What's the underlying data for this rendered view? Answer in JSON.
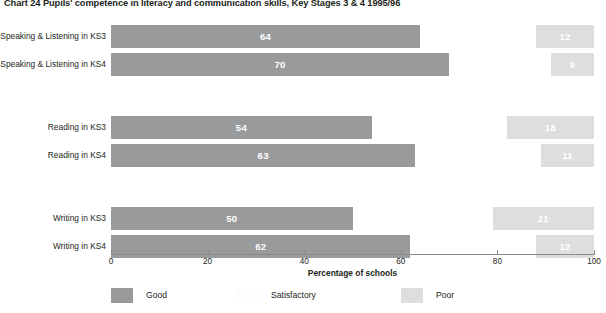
{
  "chart_data": {
    "type": "bar",
    "orientation": "horizontal",
    "stacked": true,
    "title": "Chart 24  Pupils' competence in literacy and communication skills, Key Stages 3 & 4 1995/96",
    "xlabel": "Percentage of schools",
    "ylabel": "",
    "xlim": [
      0,
      100
    ],
    "xticks": [
      0,
      20,
      40,
      60,
      80,
      100
    ],
    "xtick_labels": [
      "0",
      "20",
      "40",
      "60",
      "80",
      "100"
    ],
    "grid": false,
    "legend_position": "bottom",
    "categories": [
      "Speaking & Listening in KS3",
      "Speaking & Listening in KS4",
      "Reading in KS3",
      "Reading in KS4",
      "Writing in KS3",
      "Writing in KS4"
    ],
    "series": [
      {
        "name": "Good",
        "color": "#999a9c",
        "values": [
          64,
          70,
          54,
          63,
          50,
          62
        ],
        "labels": [
          "64",
          "70",
          "54",
          "63",
          "50",
          "62"
        ]
      },
      {
        "name": "Satisfactory",
        "color": "#ffffff",
        "values": [
          24,
          21,
          28,
          26,
          29,
          26
        ],
        "labels": [
          "",
          "",
          "",
          "",
          "",
          ""
        ]
      },
      {
        "name": "Poor",
        "color": "#dddedf",
        "values": [
          12,
          9,
          18,
          11,
          21,
          12
        ],
        "labels": [
          "12",
          "9",
          "18",
          "11",
          "21",
          "12"
        ]
      }
    ],
    "groups": [
      {
        "name": "Speaking & Listening",
        "rows": [
          0,
          1
        ]
      },
      {
        "name": "Reading",
        "rows": [
          2,
          3
        ]
      },
      {
        "name": "Writing",
        "rows": [
          4,
          5
        ]
      }
    ]
  },
  "legend": {
    "items": [
      {
        "label": "Good",
        "swatch": "good"
      },
      {
        "label": "Satisfactory",
        "swatch": "satisfactory"
      },
      {
        "label": "Poor",
        "swatch": "poor"
      }
    ]
  },
  "colors": {
    "good": "#999a9c",
    "satisfactory": "#ffffff",
    "poor": "#dddedf",
    "axis": "#8b8b8b",
    "text": "#231f20",
    "bar_label_text": "#ffffff"
  }
}
